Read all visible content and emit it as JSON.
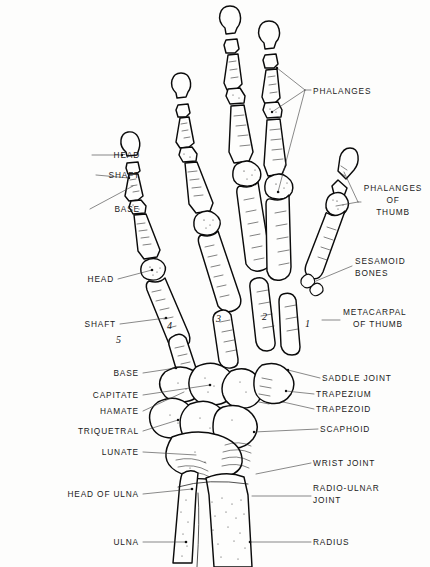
{
  "figure": {
    "background_color": "#fdfdfc",
    "ink_color": "#0b0b0b",
    "leader_color": "#3a3a3a"
  },
  "labels_left": [
    {
      "id": "head-phalanx",
      "text": "HEAD",
      "x": 48,
      "y": 158
    },
    {
      "id": "shaft-phalanx",
      "text": "SHAFT",
      "x": 48,
      "y": 178
    },
    {
      "id": "base-phalanx",
      "text": "BASE",
      "x": 48,
      "y": 212
    },
    {
      "id": "head-metacarpal",
      "text": "HEAD",
      "x": 80,
      "y": 282
    },
    {
      "id": "shaft-metacarpal",
      "text": "SHAFT",
      "x": 80,
      "y": 327
    },
    {
      "id": "base-metacarpal",
      "text": "BASE",
      "x": 101,
      "y": 376
    },
    {
      "id": "capitate",
      "text": "CAPITATE",
      "x": 68,
      "y": 398
    },
    {
      "id": "hamate",
      "text": "HAMATE",
      "x": 78,
      "y": 414
    },
    {
      "id": "triquetral",
      "text": "TRIQUETRAL",
      "x": 56,
      "y": 434
    },
    {
      "id": "lunate",
      "text": "LUNATE",
      "x": 76,
      "y": 455
    },
    {
      "id": "head-of-ulna",
      "text": "HEAD OF ULNA",
      "x": 42,
      "y": 497
    },
    {
      "id": "ulna",
      "text": "ULNA",
      "x": 86,
      "y": 545
    }
  ],
  "labels_right": [
    {
      "id": "phalanges",
      "text": "PHALANGES",
      "x": 313,
      "y": 92
    },
    {
      "id": "phalanges-thumb-1",
      "text": "PHALANGES",
      "x": 363,
      "y": 191
    },
    {
      "id": "phalanges-thumb-2",
      "text": "OF",
      "x": 363,
      "y": 202
    },
    {
      "id": "phalanges-thumb-3",
      "text": "THUMB",
      "x": 363,
      "y": 213
    },
    {
      "id": "sesamoid-1",
      "text": "SESAMOID",
      "x": 355,
      "y": 262
    },
    {
      "id": "sesamoid-2",
      "text": "BONES",
      "x": 355,
      "y": 273
    },
    {
      "id": "metacarpal-thumb-1",
      "text": "METACARPAL",
      "x": 342,
      "y": 313
    },
    {
      "id": "metacarpal-thumb-2",
      "text": "OF THUMB",
      "x": 352,
      "y": 325
    },
    {
      "id": "saddle-joint",
      "text": "SADDLE  JOINT",
      "x": 322,
      "y": 381
    },
    {
      "id": "trapezium",
      "text": "TRAPEZIUM",
      "x": 316,
      "y": 397
    },
    {
      "id": "trapezoid",
      "text": "TRAPEZOID",
      "x": 316,
      "y": 412
    },
    {
      "id": "scaphoid",
      "text": "SCAPHOID",
      "x": 320,
      "y": 432
    },
    {
      "id": "wrist-joint",
      "text": "WRIST  JOINT",
      "x": 313,
      "y": 466
    },
    {
      "id": "radio-ulnar-1",
      "text": "RADIO-ULNAR",
      "x": 313,
      "y": 489
    },
    {
      "id": "radio-ulnar-2",
      "text": "JOINT",
      "x": 313,
      "y": 500
    },
    {
      "id": "radius",
      "text": "RADIUS",
      "x": 313,
      "y": 545
    }
  ],
  "metacarpal_numbers": [
    {
      "id": "metacarpal-5",
      "text": "5",
      "x": 116,
      "y": 343
    },
    {
      "id": "metacarpal-4",
      "text": "4",
      "x": 167,
      "y": 329
    },
    {
      "id": "metacarpal-3",
      "text": "3",
      "x": 216,
      "y": 322
    },
    {
      "id": "metacarpal-2",
      "text": "2",
      "x": 262,
      "y": 320
    },
    {
      "id": "metacarpal-1",
      "text": "1",
      "x": 305,
      "y": 327
    }
  ]
}
